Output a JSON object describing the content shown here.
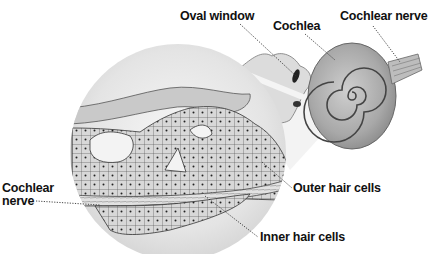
{
  "diagram": {
    "labels": {
      "oval_window": "Oval window",
      "cochlea": "Cochlea",
      "cochlear_nerve_top": "Cochlear nerve",
      "cochlear_nerve_left_line1": "Cochlear",
      "cochlear_nerve_left_line2": "nerve",
      "outer_hair_cells": "Outer hair cells",
      "inner_hair_cells": "Inner hair cells"
    },
    "colors": {
      "background": "#ffffff",
      "text": "#111111",
      "illustration_light": "#e6e6e6",
      "illustration_mid": "#b5b5b5",
      "illustration_dark": "#3a3a3a",
      "leader_line": "#333333"
    }
  }
}
